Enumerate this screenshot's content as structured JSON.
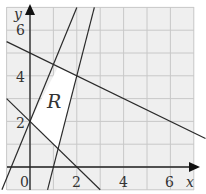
{
  "chart_data": {
    "type": "line",
    "title": "",
    "xlabel": "x",
    "ylabel": "y",
    "xlim": [
      -1,
      7.5
    ],
    "ylim": [
      -1,
      7
    ],
    "grid": true,
    "x_ticks": [
      0,
      2,
      4,
      6
    ],
    "y_ticks": [
      2,
      4,
      6
    ],
    "series": [
      {
        "name": "x + y = 2",
        "points": [
          [
            -1,
            3
          ],
          [
            3,
            -1
          ]
        ]
      },
      {
        "name": "x + 2y = 10",
        "points": [
          [
            -1,
            5.5
          ],
          [
            7.5,
            1.25
          ]
        ]
      },
      {
        "name": "y = 2.5x + 2",
        "points": [
          [
            -1.2,
            -1
          ],
          [
            2,
            7
          ]
        ]
      },
      {
        "name": "y = 4x - 4",
        "points": [
          [
            0.75,
            -1
          ],
          [
            2.75,
            7
          ]
        ]
      }
    ],
    "region": {
      "label": "R",
      "vertices": [
        [
          0,
          2
        ],
        [
          1.2,
          4.4
        ],
        [
          2,
          4
        ],
        [
          1.2,
          0.8
        ]
      ]
    },
    "annotations": [
      "R"
    ]
  },
  "labels": {
    "x_axis": "x",
    "y_axis": "y",
    "origin": "0",
    "x2": "2",
    "x4": "4",
    "x6": "6",
    "y2": "2",
    "y4": "4",
    "y6": "6",
    "region": "R"
  },
  "colors": {
    "grid": "#c8c8c8",
    "background": "#efefef",
    "lines": "#2a2a2a",
    "region": "#ffffff"
  }
}
